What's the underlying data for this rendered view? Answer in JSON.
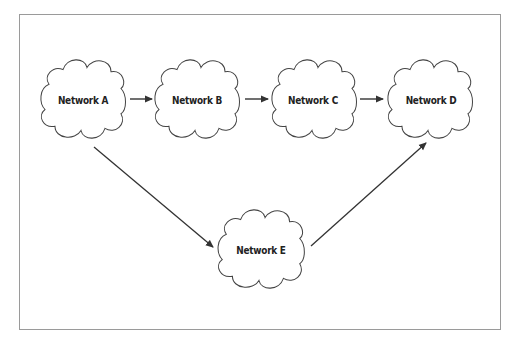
{
  "diagram": {
    "type": "network-topology",
    "colors": {
      "stroke": "#333333",
      "frame": "#9a9a9a",
      "text": "#222222",
      "background": "#ffffff"
    },
    "nodes": [
      {
        "id": "A",
        "label": "Network A",
        "cx": 83,
        "cy": 99
      },
      {
        "id": "B",
        "label": "Network B",
        "cx": 197,
        "cy": 99
      },
      {
        "id": "C",
        "label": "Network C",
        "cx": 314,
        "cy": 99
      },
      {
        "id": "D",
        "label": "Network D",
        "cx": 430,
        "cy": 99
      },
      {
        "id": "E",
        "label": "Network E",
        "cx": 261,
        "cy": 249
      }
    ],
    "edges": [
      {
        "from": "A",
        "to": "B"
      },
      {
        "from": "B",
        "to": "C"
      },
      {
        "from": "C",
        "to": "D"
      },
      {
        "from": "A",
        "to": "E"
      },
      {
        "from": "E",
        "to": "D"
      }
    ]
  }
}
